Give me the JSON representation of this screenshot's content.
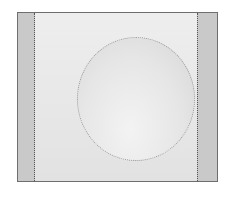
{
  "image": {
    "description": "grayscale photo of a square frame with darker side strips and a light circular disc in the center",
    "colors": {
      "frame_border": "#6e6e6e",
      "side_strips": "#c9c9c9",
      "center_panel": "#e4e4e4",
      "disc": "#ececec"
    }
  }
}
